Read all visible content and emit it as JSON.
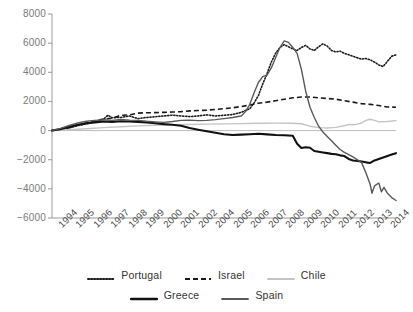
{
  "chart_data": {
    "type": "line",
    "title": "",
    "xlabel": "",
    "ylabel": "",
    "ylim": [
      -6000,
      8000
    ],
    "yticks": [
      8000,
      6000,
      4000,
      2000,
      0,
      -2000,
      -4000,
      -6000
    ],
    "ytick_labels": [
      "8000",
      "6000",
      "4000",
      "2000",
      "0",
      "-2000",
      "-4000",
      "-6000"
    ],
    "grid": false,
    "legend_position": "bottom",
    "categories": [
      "1994",
      "1995",
      "1996",
      "1997",
      "1998",
      "1999",
      "2000",
      "2001",
      "2002",
      "2004",
      "2005",
      "2006",
      "2007",
      "2008",
      "2009",
      "2010",
      "2011",
      "2012",
      "2013",
      "2014"
    ],
    "x_start": 1994,
    "x_end": 2014,
    "series": [
      {
        "name": "Portugal",
        "style": "dotted",
        "color": "#1a1a1a",
        "x": [
          1994,
          1994.5,
          1995,
          1995.5,
          1996,
          1996.5,
          1997,
          1997.25,
          1997.5,
          1998,
          1998.5,
          1999,
          1999.5,
          2000,
          2000.5,
          2001,
          2001.5,
          2002,
          2002.5,
          2003,
          2003.5,
          2004,
          2004.5,
          2005,
          2005.5,
          2005.75,
          2006,
          2006.25,
          2006.5,
          2006.75,
          2007,
          2007.25,
          2007.5,
          2007.75,
          2008,
          2008.25,
          2008.5,
          2008.75,
          2009,
          2009.25,
          2009.5,
          2009.75,
          2010,
          2010.25,
          2010.5,
          2010.75,
          2011,
          2011.25,
          2011.5,
          2011.75,
          2012,
          2012.25,
          2012.5,
          2012.75,
          2013,
          2013.25,
          2013.5,
          2013.75,
          2014
        ],
        "y": [
          0,
          60,
          180,
          340,
          460,
          600,
          780,
          1050,
          880,
          900,
          1000,
          820,
          900,
          950,
          1000,
          1060,
          1000,
          960,
          1000,
          1080,
          1000,
          1050,
          1100,
          1250,
          1500,
          1900,
          2400,
          3200,
          3900,
          4700,
          5300,
          5700,
          5900,
          5750,
          5600,
          5500,
          5700,
          5850,
          5600,
          5500,
          5750,
          5950,
          5800,
          5500,
          5400,
          5450,
          5300,
          5200,
          5100,
          5000,
          4900,
          4950,
          4850,
          4700,
          4500,
          4400,
          4750,
          5100,
          5200
        ]
      },
      {
        "name": "Israel",
        "style": "dashed",
        "color": "#1a1a1a",
        "x": [
          1994,
          1994.5,
          1995,
          1995.5,
          1996,
          1996.5,
          1997,
          1997.5,
          1998,
          1998.5,
          1999,
          1999.5,
          2000,
          2000.5,
          2001,
          2001.5,
          2002,
          2002.5,
          2003,
          2003.5,
          2004,
          2004.5,
          2005,
          2005.5,
          2006,
          2006.5,
          2007,
          2007.5,
          2008,
          2008.5,
          2009,
          2009.5,
          2010,
          2010.5,
          2011,
          2011.5,
          2012,
          2012.5,
          2013,
          2013.5,
          2014
        ],
        "y": [
          0,
          80,
          220,
          380,
          520,
          660,
          790,
          850,
          1050,
          1080,
          1200,
          1220,
          1230,
          1250,
          1270,
          1300,
          1350,
          1380,
          1400,
          1450,
          1500,
          1560,
          1650,
          1750,
          1880,
          1950,
          2050,
          2150,
          2250,
          2300,
          2300,
          2250,
          2200,
          2150,
          2050,
          1950,
          1850,
          1800,
          1720,
          1620,
          1600
        ]
      },
      {
        "name": "Chile",
        "style": "solid",
        "color": "#c4c4c4",
        "x": [
          1994,
          1995,
          1996,
          1997,
          1998,
          1999,
          2000,
          2001,
          2002,
          2003,
          2004,
          2005,
          2006,
          2007,
          2008,
          2008.5,
          2009,
          2009.5,
          2010,
          2010.5,
          2011,
          2011.25,
          2011.5,
          2011.75,
          2012,
          2012.25,
          2012.5,
          2012.75,
          2013,
          2013.5,
          2014
        ],
        "y": [
          0,
          60,
          130,
          200,
          260,
          320,
          370,
          400,
          420,
          440,
          460,
          480,
          500,
          510,
          500,
          470,
          300,
          200,
          180,
          220,
          330,
          420,
          400,
          440,
          520,
          700,
          780,
          700,
          600,
          620,
          680
        ]
      },
      {
        "name": "Greece",
        "style": "solid-thick",
        "color": "#111111",
        "x": [
          1994,
          1994.5,
          1995,
          1995.5,
          1996,
          1996.5,
          1997,
          1997.5,
          1998,
          1998.5,
          1999,
          1999.5,
          2000,
          2000.5,
          2001,
          2001.5,
          2002,
          2002.5,
          2003,
          2003.5,
          2004,
          2004.5,
          2005,
          2005.5,
          2006,
          2006.5,
          2007,
          2007.5,
          2008,
          2008.25,
          2008.5,
          2008.75,
          2009,
          2009.25,
          2009.5,
          2009.75,
          2010,
          2010.25,
          2010.5,
          2010.75,
          2011,
          2011.25,
          2011.5,
          2011.75,
          2012,
          2012.25,
          2012.5,
          2012.75,
          2013,
          2013.25,
          2013.5,
          2013.75,
          2014
        ],
        "y": [
          0,
          100,
          260,
          400,
          500,
          560,
          620,
          600,
          640,
          620,
          600,
          560,
          500,
          440,
          400,
          330,
          180,
          60,
          -50,
          -150,
          -250,
          -300,
          -280,
          -250,
          -220,
          -260,
          -300,
          -320,
          -360,
          -900,
          -1200,
          -1150,
          -1180,
          -1400,
          -1450,
          -1500,
          -1550,
          -1600,
          -1620,
          -1700,
          -1750,
          -1950,
          -2050,
          -2080,
          -2120,
          -2180,
          -2220,
          -2050,
          -1950,
          -1850,
          -1750,
          -1650,
          -1550
        ]
      },
      {
        "name": "Spain",
        "style": "solid",
        "color": "#595959",
        "x": [
          1994,
          1994.5,
          1995,
          1995.5,
          1996,
          1996.5,
          1997,
          1997.5,
          1998,
          1998.5,
          1999,
          1999.5,
          2000,
          2000.5,
          2001,
          2001.5,
          2002,
          2002.5,
          2003,
          2003.5,
          2004,
          2004.5,
          2005,
          2005.25,
          2005.5,
          2005.75,
          2006,
          2006.25,
          2006.5,
          2006.75,
          2007,
          2007.25,
          2007.5,
          2007.75,
          2008,
          2008.25,
          2008.5,
          2008.75,
          2009,
          2009.25,
          2009.5,
          2009.75,
          2010,
          2010.25,
          2010.5,
          2010.75,
          2011,
          2011.25,
          2011.5,
          2011.75,
          2012,
          2012.25,
          2012.5,
          2012.6,
          2012.75,
          2013,
          2013.15,
          2013.3,
          2013.5,
          2013.75,
          2014
        ],
        "y": [
          0,
          150,
          350,
          520,
          640,
          700,
          740,
          700,
          760,
          720,
          700,
          640,
          600,
          560,
          620,
          700,
          720,
          680,
          700,
          750,
          820,
          900,
          1000,
          1300,
          1800,
          2600,
          3300,
          3700,
          3800,
          4300,
          5000,
          5700,
          6150,
          6050,
          5700,
          5300,
          4200,
          2700,
          1600,
          900,
          300,
          -100,
          -400,
          -700,
          -1000,
          -1300,
          -1500,
          -1650,
          -1800,
          -2000,
          -2200,
          -2900,
          -3700,
          -4300,
          -3800,
          -3600,
          -4200,
          -3900,
          -4300,
          -4600,
          -4800
        ]
      }
    ]
  },
  "axes": {
    "ytick_labels": [
      "8000",
      "6000",
      "4000",
      "2000",
      "0",
      "-2000",
      "-4000",
      "-6000"
    ],
    "xtick_labels": [
      "1994",
      "1995",
      "1996",
      "1997",
      "1998",
      "1999",
      "2000",
      "2001",
      "2002",
      "2004",
      "2005",
      "2006",
      "2007",
      "2008",
      "2009",
      "2010",
      "2011",
      "2012",
      "2013",
      "2014"
    ]
  },
  "legend": {
    "row1": [
      {
        "label": "Portugal",
        "style": "dotted",
        "color": "#1a1a1a"
      },
      {
        "label": "Israel",
        "style": "dashed",
        "color": "#1a1a1a"
      },
      {
        "label": "Chile",
        "style": "solid",
        "color": "#c4c4c4"
      }
    ],
    "row2": [
      {
        "label": "Greece",
        "style": "solid-thick",
        "color": "#111111"
      },
      {
        "label": "Spain",
        "style": "solid",
        "color": "#595959"
      }
    ]
  },
  "colors": {
    "axis": "#9a9a9a",
    "ytick_text": "#7a7a7a",
    "xtick_text": "#4a4a4a",
    "zero_line": "#bdbdbd",
    "background": "#ffffff"
  }
}
